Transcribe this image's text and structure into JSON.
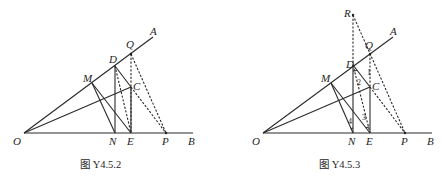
{
  "figures": [
    {
      "caption": "图 Y4.5.2",
      "points": {
        "O": "O",
        "A": "A",
        "B": "B",
        "Q": "Q",
        "D": "D",
        "M": "M",
        "C": "C",
        "N": "N",
        "E": "E",
        "P": "P"
      }
    },
    {
      "caption": "图 Y4.5.3",
      "points": {
        "O": "O",
        "A": "A",
        "B": "B",
        "R": "R",
        "Q": "Q",
        "D": "D",
        "M": "M",
        "C": "C",
        "N": "N",
        "E": "E",
        "P": "P"
      },
      "angles": {
        "a1": "1",
        "a2": "2",
        "a3": "3",
        "a4": "4"
      }
    }
  ]
}
